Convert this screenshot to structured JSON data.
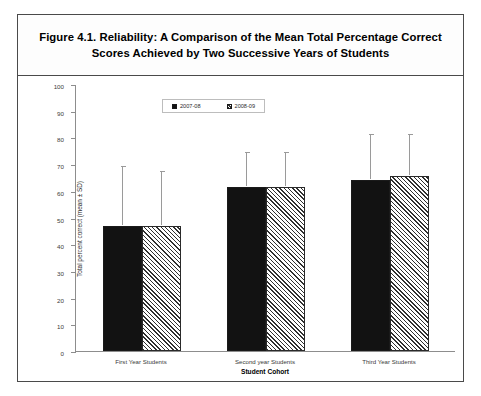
{
  "figure": {
    "title": "Figure 4.1.  Reliability: A Comparison of the Mean Total Percentage Correct Scores Achieved by Two Successive Years of Students"
  },
  "chart_data": {
    "type": "bar",
    "title": "Figure 4.1.  Reliability: A Comparison of the Mean Total Percentage Correct Scores Achieved by Two Successive Years of Students",
    "xlabel": "Student Cohort",
    "ylabel": "Total percent correct (mean ± SD)",
    "categories": [
      "First Year Students",
      "Second year Students",
      "Third Year Students"
    ],
    "series": [
      {
        "name": "2007-08",
        "fill": "solid-black",
        "values": [
          47,
          61.5,
          64
        ],
        "errors": [
          22,
          12.5,
          17
        ]
      },
      {
        "name": "2008-09",
        "fill": "hatched",
        "values": [
          47,
          61.5,
          65.5
        ],
        "errors": [
          20,
          12.5,
          15.5
        ]
      }
    ],
    "ylim": [
      0,
      100
    ],
    "yticks": [
      0,
      10,
      20,
      30,
      40,
      50,
      60,
      70,
      80,
      90,
      100
    ],
    "ytick_labels": [
      "0",
      "10",
      "20",
      "30",
      "40",
      "50",
      "60",
      "70",
      "80",
      "90",
      "100"
    ],
    "grid": false,
    "legend_position": "top-center",
    "error_bar_type": "upper-only (SD)"
  },
  "legend": {
    "items": [
      {
        "label": "2007-08",
        "fill": "solid-black"
      },
      {
        "label": "2008-09",
        "fill": "hatched"
      }
    ]
  },
  "colors": {
    "series_1": "#121212",
    "series_2_hatch": "#303030",
    "axis": "#8d8d8d",
    "error_bar": "#9a9a9a",
    "frame": "#4a4a4a",
    "background": "#ffffff"
  }
}
